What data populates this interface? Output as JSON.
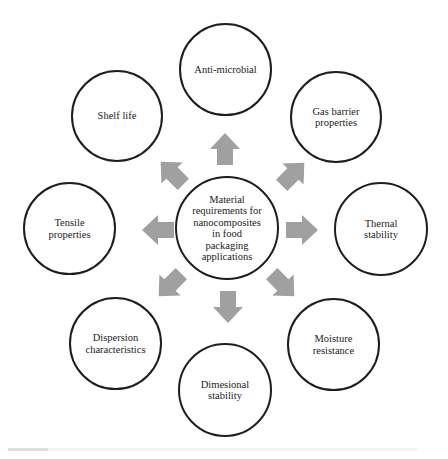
{
  "diagram": {
    "center": {
      "label": "Material\nrequirements for\nnanocomposites\nin food\npackaging\napplications"
    },
    "nodes": [
      {
        "id": "anti-microbial",
        "label": "Anti-microbial"
      },
      {
        "id": "gas-barrier",
        "label": "Gas barrier\nproperties"
      },
      {
        "id": "thermal-stability",
        "label": "Thernal\nstability"
      },
      {
        "id": "moisture-resistance",
        "label": "Moisture\nresistance"
      },
      {
        "id": "dimensional-stability",
        "label": "Dimesional\nstability"
      },
      {
        "id": "dispersion-characteristics",
        "label": "Dispersion\ncharacteristics"
      },
      {
        "id": "tensile-properties",
        "label": "Tensile\nproperties"
      },
      {
        "id": "shelf-life",
        "label": "Shelf life"
      }
    ],
    "colors": {
      "arrow": "#a0a0a0",
      "circle_stroke": "#1e1e1e",
      "background": "#ffffff"
    }
  }
}
